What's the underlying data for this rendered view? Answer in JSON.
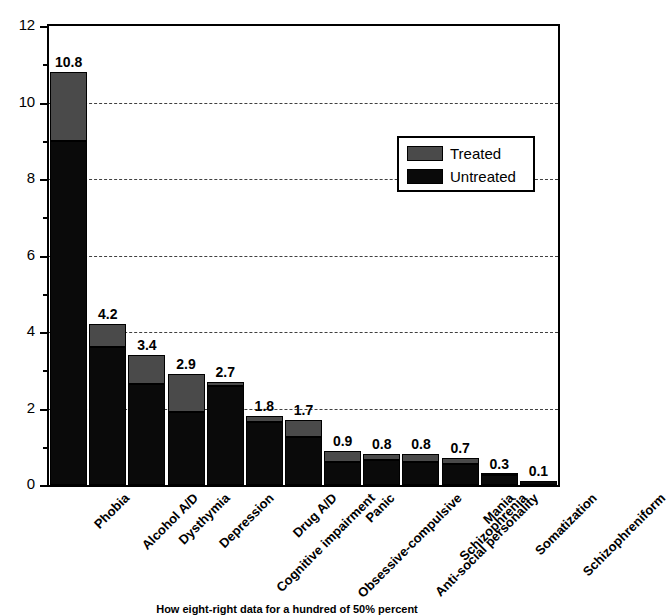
{
  "chart_data": {
    "type": "bar",
    "subtype": "stacked-vertical",
    "title": "",
    "xlabel": "",
    "ylabel": "",
    "ylim": [
      0,
      12
    ],
    "ytick_step": 2,
    "yminor_step": 1,
    "ytick_labels": [
      "0",
      "2",
      "4",
      "6",
      "8",
      "10",
      "12"
    ],
    "grid": "horizontal-dashed",
    "legend_position": "upper-right-inside",
    "categories": [
      "Phobia",
      "Alcohol A/D",
      "Dysthymia",
      "Depression",
      "Cognitive impairment",
      "Drug A/D",
      "Obsessive-compulsive",
      "Panic",
      "Anti-social personality",
      "Schizophrenia",
      "Mania",
      "Somatization",
      "Schizophreniform"
    ],
    "series": [
      {
        "name": "Untreated",
        "color": "#0a0a0a",
        "values": [
          9.0,
          3.6,
          2.65,
          1.9,
          2.6,
          1.65,
          1.25,
          0.6,
          0.65,
          0.6,
          0.55,
          0.25,
          0.1
        ]
      },
      {
        "name": "Treated",
        "color": "#4a4a4a",
        "values": [
          1.8,
          0.6,
          0.75,
          1.0,
          0.1,
          0.15,
          0.45,
          0.3,
          0.15,
          0.2,
          0.15,
          0.05,
          0.0
        ]
      }
    ],
    "totals": [
      10.8,
      4.2,
      3.4,
      2.9,
      2.7,
      1.8,
      1.7,
      0.9,
      0.8,
      0.8,
      0.7,
      0.3,
      0.1
    ],
    "value_labels": [
      "10.8",
      "4.2",
      "3.4",
      "2.9",
      "2.7",
      "1.8",
      "1.7",
      "0.9",
      "0.8",
      "0.8",
      "0.7",
      "0.3",
      "0.1"
    ]
  },
  "legend": {
    "items": [
      {
        "label": "Treated",
        "color": "#4a4a4a"
      },
      {
        "label": "Untreated",
        "color": "#0a0a0a"
      }
    ]
  },
  "caption": {
    "text": "How eight-right data for a hundred of 50% percent"
  }
}
